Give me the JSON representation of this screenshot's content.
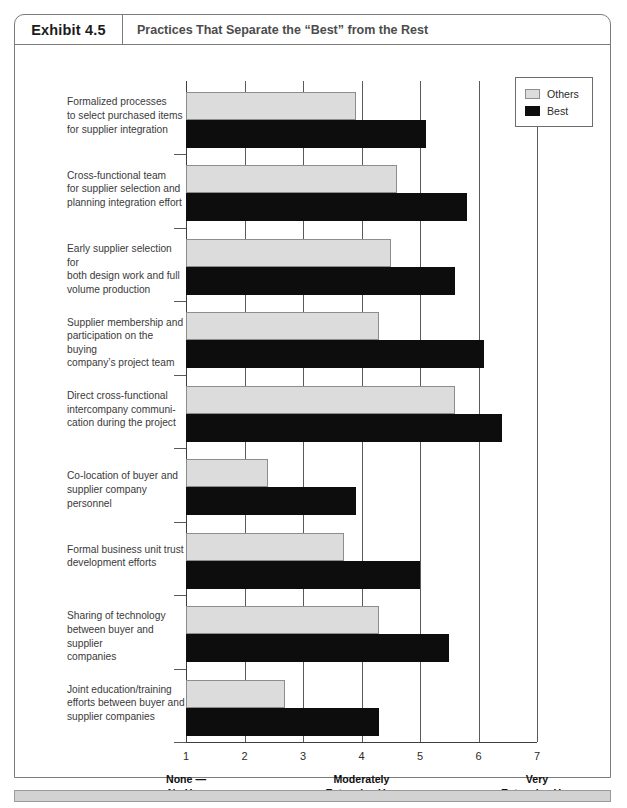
{
  "header": {
    "exhibit_number": "Exhibit 4.5",
    "title": "Practices That Separate the “Best” from the Rest"
  },
  "legend": {
    "items": [
      {
        "label": "Others",
        "color": "#dcdcdc",
        "key": "others"
      },
      {
        "label": "Best",
        "color": "#0d0d0d",
        "key": "best"
      }
    ]
  },
  "axis": {
    "ticks": [
      "1",
      "2",
      "3",
      "4",
      "5",
      "6",
      "7"
    ],
    "captions": [
      {
        "at": 1,
        "line1": "None —",
        "line2": "No Use"
      },
      {
        "at": 4,
        "line1": "Moderately",
        "line2": "Extensive Use"
      },
      {
        "at": 7,
        "line1": "Very",
        "line2": "Extensive Use"
      }
    ]
  },
  "chart_data": {
    "type": "bar",
    "orientation": "horizontal",
    "title": "Practices That Separate the “Best” from the Rest",
    "xlabel": "",
    "ylabel": "",
    "xlim": [
      1,
      7
    ],
    "grid": true,
    "legend_position": "top-right",
    "scale_anchors": {
      "1": "None — No Use",
      "4": "Moderately Extensive Use",
      "7": "Very Extensive Use"
    },
    "categories": [
      "Formalized processes to select purchased items for supplier integration",
      "Cross-functional team for supplier selection and planning integration effort",
      "Early supplier selection for both design work and full volume production",
      "Supplier membership and participation on the buying company's project team",
      "Direct cross-functional intercompany communication during the project",
      "Co-location of buyer and supplier company personnel",
      "Formal business unit trust development efforts",
      "Sharing of technology between buyer and supplier companies",
      "Joint education/training efforts between buyer and supplier companies"
    ],
    "category_lines": [
      [
        "Formalized processes",
        "to select purchased items",
        "for supplier integration"
      ],
      [
        "Cross-functional team",
        "for supplier selection and",
        "planning integration effort"
      ],
      [
        "Early supplier selection for",
        "both design work and full",
        "volume production"
      ],
      [
        "Supplier membership and",
        "participation on the buying",
        "company’s project team"
      ],
      [
        "Direct cross-functional",
        "intercompany communi-",
        "cation during the project"
      ],
      [
        "Co-location of buyer and",
        "supplier company personnel"
      ],
      [
        "Formal business unit trust",
        "development efforts"
      ],
      [
        "Sharing of technology",
        "between buyer and supplier",
        "companies"
      ],
      [
        "Joint education/training",
        "efforts between buyer and",
        "supplier companies"
      ]
    ],
    "series": [
      {
        "name": "Others",
        "values": [
          3.9,
          4.6,
          4.5,
          4.3,
          5.6,
          2.4,
          3.7,
          4.3,
          2.7
        ]
      },
      {
        "name": "Best",
        "values": [
          5.1,
          5.8,
          5.6,
          6.1,
          6.4,
          3.9,
          5.0,
          5.5,
          4.3
        ]
      }
    ]
  }
}
